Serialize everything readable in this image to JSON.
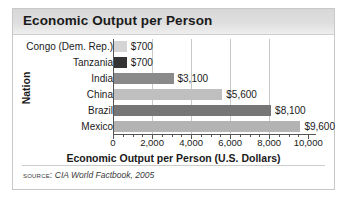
{
  "figure": {
    "title": "Economic Output per Person",
    "source_label": "Source:",
    "source_reference": "CIA World Factbook, 2005"
  },
  "chart_data": {
    "type": "bar",
    "orientation": "horizontal",
    "title": "Economic Output per Person",
    "xlabel": "Economic Output per Person (U.S. Dollars)",
    "ylabel": "Nation",
    "categories": [
      "Congo (Dem. Rep.)",
      "Tanzania",
      "India",
      "China",
      "Brazil",
      "Mexico"
    ],
    "values": [
      700,
      700,
      3100,
      5600,
      8100,
      9600
    ],
    "value_labels": [
      "$700",
      "$700",
      "$3,100",
      "$5,600",
      "$8,100",
      "$9,600"
    ],
    "bar_colors": [
      "#d4d4d4",
      "#333333",
      "#8a8a8a",
      "#bfbfbf",
      "#767676",
      "#b3b3b3"
    ],
    "xlim": [
      0,
      10400
    ],
    "xticks": [
      0,
      2000,
      4000,
      6000,
      8000,
      10000
    ],
    "xtick_labels": [
      "0",
      "2,000",
      "4,000",
      "6,000",
      "8,000",
      "10,000"
    ],
    "minor_tick_interval": 500,
    "gridlines": [
      2000,
      4000,
      6000,
      8000
    ],
    "grid": true,
    "legend": false
  }
}
